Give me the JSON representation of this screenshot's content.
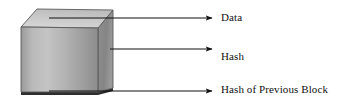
{
  "figure": {
    "name": "blockchain-block-diagram",
    "background_color": "#ffffff",
    "shape": {
      "name": "cube",
      "kind": "3d-block",
      "top_face_color": "#cfcfcf",
      "front_face_color": "#a9a9a9",
      "right_face_color": "#8e8e8e",
      "outline_color": "#4a4a4a",
      "shadow_color": "#2b2b2b"
    },
    "annotation_color": "#1a1a1a"
  },
  "callouts": [
    {
      "id": "data",
      "label": "Data",
      "icon": "arrow-right-icon",
      "target": "top-face",
      "arrow_start_x": 49,
      "arrow_start_y": 18,
      "arrow_end_x": 214,
      "arrow_end_y": 18
    },
    {
      "id": "hash",
      "label": "Hash",
      "icon": "arrow-right-icon",
      "target": "front-face",
      "arrow_start_x": 110,
      "arrow_start_y": 49,
      "arrow_end_x": 214,
      "arrow_end_y": 49
    },
    {
      "id": "previous-hash",
      "label": "Hash of Previous Block",
      "icon": "arrow-right-icon",
      "target": "bottom-edge",
      "arrow_start_x": 49,
      "arrow_start_y": 91,
      "arrow_end_x": 214,
      "arrow_end_y": 91
    }
  ]
}
